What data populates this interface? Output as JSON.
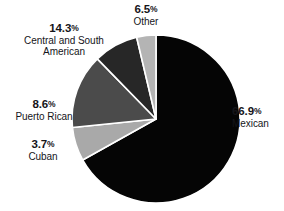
{
  "chart_data": {
    "type": "pie",
    "title": "",
    "subtitle": "",
    "xlabel": "",
    "ylabel": "",
    "legend_position": "none",
    "grid": false,
    "start_angle_deg": 0,
    "direction": "clockwise",
    "units": "percent",
    "total": 100.0,
    "categories": [
      "Mexican",
      "Other",
      "Central and South American",
      "Puerto Rican",
      "Cuban"
    ],
    "values": [
      66.9,
      6.5,
      14.3,
      8.6,
      3.7
    ],
    "slices": [
      {
        "label": "Mexican",
        "percent_text": "66.9",
        "percent_symbol": "%",
        "value": 66.9,
        "color": "#050505",
        "label_align": "left"
      },
      {
        "label": "Other",
        "percent_text": "6.5",
        "percent_symbol": "%",
        "value": 6.5,
        "color": "#a9a9a9",
        "label_align": "center"
      },
      {
        "label": "Central and South American",
        "percent_text": "14.3",
        "percent_symbol": "%",
        "value": 14.3,
        "color": "#4b4b4b",
        "label_align": "center"
      },
      {
        "label": "Puerto Rican",
        "percent_text": "8.6",
        "percent_symbol": "%",
        "value": 8.6,
        "color": "#272727",
        "label_align": "center"
      },
      {
        "label": "Cuban",
        "percent_text": "3.7",
        "percent_symbol": "%",
        "value": 3.7,
        "color": "#b4b4b4",
        "label_align": "center"
      }
    ],
    "separator_color": "#ffffff",
    "background_color": "#ffffff",
    "text_color": "#15151a"
  }
}
